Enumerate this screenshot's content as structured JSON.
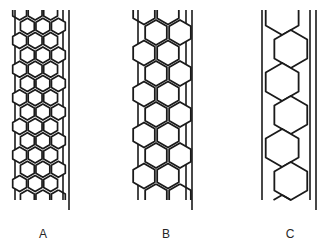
{
  "figure": {
    "background_color": "#ffffff",
    "ink_color": "#1a1a1a",
    "label_color": "#262626",
    "width": 333,
    "height": 250
  },
  "panels": [
    {
      "id": "A",
      "label": "A",
      "label_x": 43,
      "label_y": 238,
      "description": "Narrow tube packed with many small hexagonal cells, roughly three cells across",
      "tube": {
        "inner_left_x": 15,
        "inner_right_x": 63,
        "outer_right_x": 69,
        "top_y": 10,
        "bottom_y": 200,
        "outer_bottom_y": 210,
        "wall_stroke": 1.6
      },
      "cell": {
        "radius": 8.0,
        "stroke": 1.7,
        "rows": 13,
        "per_row": 3,
        "row_pitch": 14.3,
        "col_pitch": 15.5
      }
    },
    {
      "id": "B",
      "label": "B",
      "label_x": 166,
      "label_y": 238,
      "description": "Same tube diameter packed with medium hexagonal cells, roughly two cells across in a staggered zig-zag",
      "tube": {
        "inner_left_x": 138,
        "inner_right_x": 186,
        "outer_right_x": 192,
        "top_y": 10,
        "bottom_y": 200,
        "outer_bottom_y": 210,
        "wall_stroke": 1.6
      },
      "cell": {
        "radius": 12.5,
        "stroke": 1.8,
        "rows": 9,
        "per_row": 2,
        "row_pitch": 20.5,
        "col_pitch": 24.0
      }
    },
    {
      "id": "C",
      "label": "C",
      "label_x": 290,
      "label_y": 238,
      "description": "Same tube diameter packed with large hexagonal cells, a single file zig-zag chain one cell across",
      "tube": {
        "inner_left_x": 262,
        "inner_right_x": 310,
        "outer_right_x": 316,
        "top_y": 10,
        "bottom_y": 200,
        "outer_bottom_y": 210,
        "wall_stroke": 1.6
      },
      "cell": {
        "radius": 19.0,
        "stroke": 1.8,
        "rows": 5,
        "per_row": 1,
        "row_pitch": 33.0,
        "col_pitch": 0
      }
    }
  ],
  "labels": {
    "a": "A",
    "b": "B",
    "c": "C"
  }
}
